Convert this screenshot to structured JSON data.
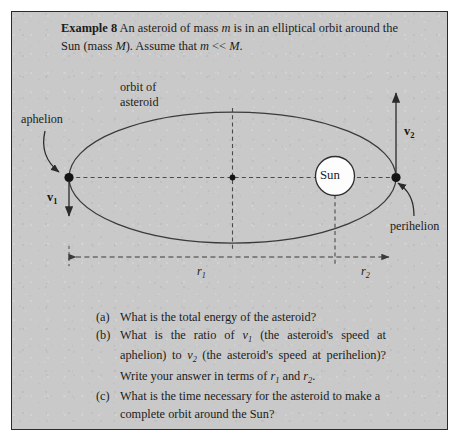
{
  "figure": {
    "background_color": "#c9c9c9",
    "border_color": "#2a2a2a",
    "ink_color": "#1c1c1c"
  },
  "prompt": {
    "label": "Example 8",
    "line1_a": " An asteroid of mass ",
    "mass_asteroid": "m",
    "line1_b": " is in an elliptical orbit",
    "line2_a": "around the Sun (mass ",
    "mass_sun": "M",
    "line2_b": "). Assume that ",
    "mass_asteroid2": "m",
    "line2_c": " << ",
    "mass_sun2": "M",
    "line2_d": "."
  },
  "diagram": {
    "orbit_label_line1": "orbit of",
    "orbit_label_line2": "asteroid",
    "aphelion_label": "aphelion",
    "perihelion_label": "perihelion",
    "sun_label": "Sun",
    "v1_label": "v",
    "v1_sub": "1",
    "v2_label": "v",
    "v2_sub": "2",
    "r1_label": "r",
    "r1_sub": "1",
    "r2_label": "r",
    "r2_sub": "2"
  },
  "questions": [
    {
      "marker": "(a)",
      "text": "What is the total energy of the asteroid?"
    },
    {
      "marker": "(b)",
      "line1_a": "What is the ratio of ",
      "line1_v": "v",
      "line1_vsub": "1",
      "line1_b": " (the asteroid's speed at",
      "line2_a": "aphelion) to ",
      "line2_v": "v",
      "line2_vsub": "2",
      "line2_b": " (the asteroid's speed at perihelion)?",
      "line3_a": "Write your answer in terms of ",
      "line3_r1": "r",
      "line3_r1sub": "1",
      "line3_b": " and ",
      "line3_r2": "r",
      "line3_r2sub": "2",
      "line3_c": "."
    },
    {
      "marker": "(c)",
      "line1": "What is the time necessary for the asteroid to make",
      "line2": "a complete orbit around the Sun?"
    }
  ]
}
